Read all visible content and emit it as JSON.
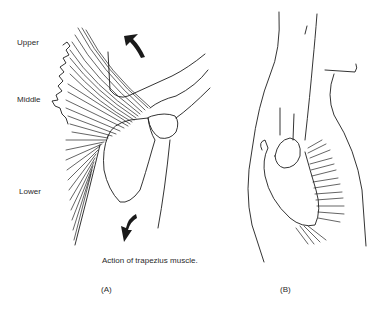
{
  "figure": {
    "caption": "Action of trapezius muscle.",
    "panels": [
      {
        "id": "A",
        "label": "(A)"
      },
      {
        "id": "B",
        "label": "(B)"
      }
    ],
    "region_labels": {
      "upper": "Upper",
      "middle": "Middle",
      "lower": "Lower"
    },
    "arrows": [
      {
        "panel": "A",
        "direction": "upward-rotation",
        "position": "top"
      },
      {
        "panel": "A",
        "direction": "downward",
        "position": "bottom"
      }
    ],
    "colors": {
      "line": "#1d1d1d",
      "background": "#ffffff"
    }
  }
}
